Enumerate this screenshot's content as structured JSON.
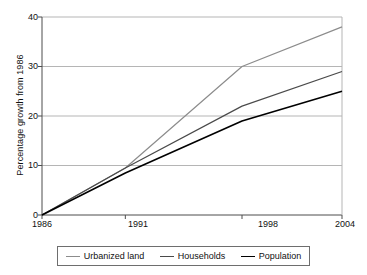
{
  "chart_data": {
    "type": "line",
    "title": "",
    "xlabel": "",
    "ylabel": "Percentage growth from 1986",
    "x": [
      1986,
      1991,
      1998,
      2004
    ],
    "xtick_labels": [
      "1986",
      "1991",
      "1998",
      "2004"
    ],
    "ytick_labels": [
      "0",
      "10",
      "20",
      "30",
      "40"
    ],
    "yticks": [
      0,
      10,
      20,
      30,
      40
    ],
    "ylim": [
      0,
      40
    ],
    "xlim": [
      1986,
      2004
    ],
    "grid": "horizontal",
    "legend_position": "bottom",
    "series": [
      {
        "name": "Urbanized land",
        "values": [
          0,
          9.5,
          30,
          38
        ],
        "color": "#8c8c8c"
      },
      {
        "name": "Households",
        "values": [
          0,
          9.5,
          22,
          29
        ],
        "color": "#4a4a4a"
      },
      {
        "name": "Population",
        "values": [
          0,
          8.5,
          19,
          25
        ],
        "color": "#000000"
      }
    ]
  },
  "axes": {
    "y_title": "Percentage growth from 1986",
    "y_labels": [
      "40",
      "30",
      "20",
      "10",
      "0"
    ],
    "x_labels": [
      "1986",
      "1991",
      "1998",
      "2004"
    ]
  },
  "legend": {
    "items": [
      {
        "label": "Urbanized land",
        "color": "#8c8c8c"
      },
      {
        "label": "Households",
        "color": "#4a4a4a"
      },
      {
        "label": "Population",
        "color": "#000000"
      }
    ]
  },
  "colors": {
    "axis": "#4d4d4d",
    "grid": "#b5b5b5",
    "background": "#ffffff",
    "text": "#111111"
  }
}
